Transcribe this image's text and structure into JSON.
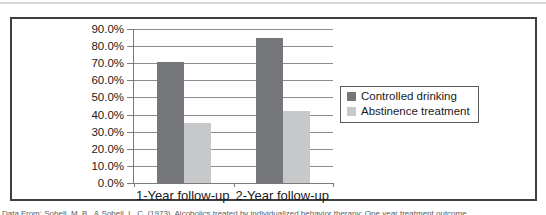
{
  "chart_data": {
    "type": "bar",
    "title": "",
    "xlabel": "",
    "ylabel": "",
    "categories": [
      "1-Year follow-up",
      "2-Year follow-up"
    ],
    "series": [
      {
        "name": "Controlled drinking",
        "color": "#76777a",
        "values": [
          71,
          85
        ]
      },
      {
        "name": "Abstinence treatment",
        "color": "#c7c8ca",
        "values": [
          35,
          42
        ]
      }
    ],
    "y_ticks": [
      "90.0%",
      "80.0%",
      "70.0%",
      "60.0%",
      "50.0%",
      "40.0%",
      "30.0%",
      "20.0%",
      "10.0%",
      "0.0%"
    ],
    "ylim": [
      0,
      90
    ],
    "unit": "percent",
    "grid": true,
    "legend_position": "right",
    "bar_width": 27,
    "style": {
      "grid_color": "#8c8c8c",
      "axis_color": "#7a7a7a",
      "frame_border_color": "#3f3f3f",
      "text_color": "#1a1a1a"
    }
  },
  "caption": {
    "text": "Data From: Sobell, M. B., & Sobell, L. C. (1973). Alcoholics treated by individualized behavior therapy: One year treatment outcome."
  }
}
